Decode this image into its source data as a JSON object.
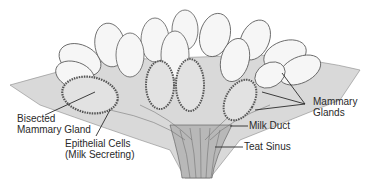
{
  "diagram": {
    "labels": {
      "bisected_line1": "Bisected",
      "bisected_line2": "Mammary Gland",
      "epithelial_line1": "Epithelial Cells",
      "epithelial_line2": "(Milk Secreting)",
      "glands_line1": "Mammary",
      "glands_line2": "Glands",
      "milk_duct": "Milk Duct",
      "teat_sinus": "Teat Sinus"
    },
    "colors": {
      "background": "#ffffff",
      "line": "#2a2a2a",
      "lobe_fill": "#f4f4f4",
      "lobe_stroke": "#5a5a5a",
      "tissue": "#bdbdbd",
      "inner_fill": "#e2e2e2"
    }
  }
}
